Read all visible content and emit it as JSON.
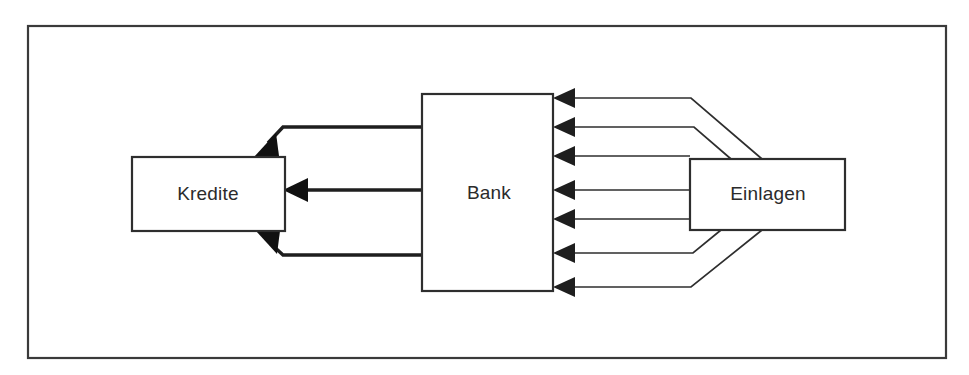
{
  "figure": {
    "title_text": "",
    "background_color": "#ffffff",
    "frame": {
      "x": 28,
      "y": 26,
      "width": 918,
      "height": 332,
      "stroke_color": "#3a3a3a"
    }
  },
  "nodes": [
    {
      "id": "kredite",
      "label": "Kredite",
      "x": 132,
      "y": 157,
      "width": 153,
      "height": 74,
      "label_x": 208,
      "label_y": 194
    },
    {
      "id": "bank",
      "label": "Bank",
      "x": 422,
      "y": 94,
      "width": 131,
      "height": 197,
      "label_x": 489,
      "label_y": 193
    },
    {
      "id": "einlagen",
      "label": "Einlagen",
      "x": 690,
      "y": 159,
      "width": 155,
      "height": 71,
      "label_x": 768,
      "label_y": 194
    }
  ],
  "flows_inbound": {
    "description": "Einlagen to Bank",
    "direction": "right-to-left",
    "count": 7,
    "arrow_color": "#1e1e1e",
    "arrow_y_positions": [
      98,
      127,
      156,
      190,
      219,
      253,
      287
    ],
    "paths": [
      "M 762 159 L 691 98 L 560 98",
      "M 730 159 L 694 127 L 560 127",
      "M 690 156 L 560 156",
      "M 690 190 L 560 190",
      "M 690 219 L 560 219",
      "M 720 230 L 692 253 L 560 253",
      "M 762 230 L 691 287 L 560 287"
    ]
  },
  "flows_outbound": {
    "description": "Bank to Kredite",
    "direction": "right-to-left",
    "count": 3,
    "arrow_color": "#111111",
    "paths": [
      "M 422 127 L 283 127 L 259 152",
      "M 422 190 L 292 190",
      "M 422 255 L 283 255 L 261 234"
    ]
  },
  "colors": {
    "stroke": "#2e2e2e",
    "arrow_fill": "#1e1e1e",
    "text": "#2b2b2b",
    "background": "#ffffff"
  }
}
